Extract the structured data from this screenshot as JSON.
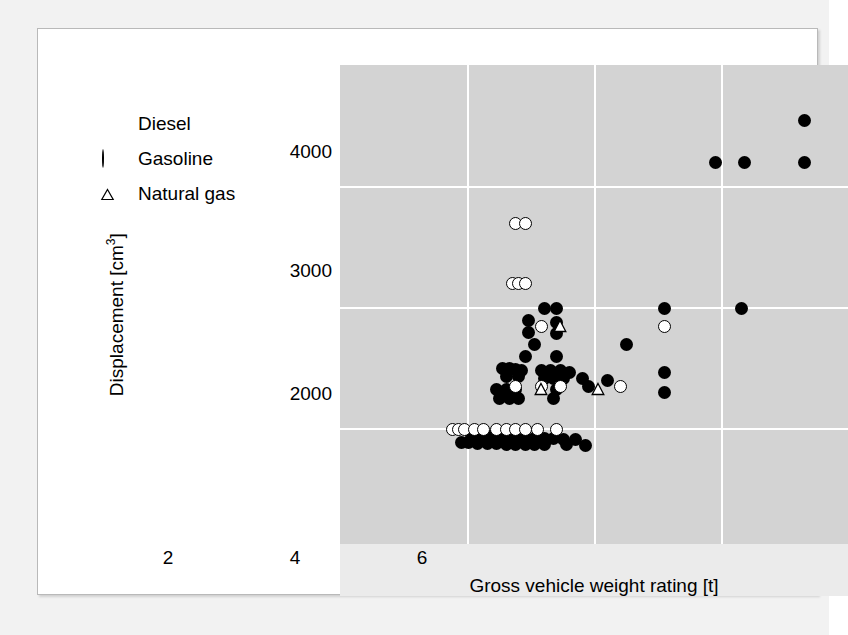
{
  "figure": {
    "panel_bg": "#d3d3d3",
    "grid_color": "#ffffff",
    "card_bg": "#ffffff",
    "page_bg": "#f2f2f2"
  },
  "legend": {
    "items": [
      {
        "label": "Diesel",
        "symbol": "filled-circle",
        "key": "diesel"
      },
      {
        "label": "Gasoline",
        "symbol": "open-circle",
        "key": "gasoline"
      },
      {
        "label": "Natural gas",
        "symbol": "open-triangle",
        "key": "natural_gas"
      }
    ]
  },
  "axes": {
    "x_label": "Gross vehicle weight rating [t]",
    "x_ticks": [
      "2",
      "4",
      "6"
    ],
    "x_tick_values": [
      2,
      4,
      6
    ],
    "y_label_text": "Displacement [cm",
    "y_label_sup": "3",
    "y_label_suffix": "]",
    "y_ticks": [
      "2000",
      "3000",
      "4000"
    ],
    "y_tick_values": [
      2000,
      3000,
      4000
    ]
  },
  "chart_data": {
    "type": "scatter",
    "title": "",
    "xlabel": "Gross vehicle weight rating [t]",
    "ylabel": "Displacement [cm3]",
    "xlim": [
      1.3,
      7.8
    ],
    "ylim": [
      1700,
      4750
    ],
    "grid": true,
    "legend_position": "upper-left-outside",
    "series": [
      {
        "name": "Diesel",
        "marker": "filled-circle",
        "color": "#000000",
        "points": [
          [
            7.3,
            4550
          ],
          [
            5.9,
            4200
          ],
          [
            6.35,
            4200
          ],
          [
            7.3,
            4200
          ],
          [
            3.2,
            3000
          ],
          [
            3.4,
            3000
          ],
          [
            5.1,
            3000
          ],
          [
            6.3,
            3000
          ],
          [
            2.95,
            2900
          ],
          [
            3.4,
            2880
          ],
          [
            4.5,
            2700
          ],
          [
            2.95,
            2800
          ],
          [
            3.4,
            2790
          ],
          [
            3.05,
            2700
          ],
          [
            2.9,
            2600
          ],
          [
            3.4,
            2600
          ],
          [
            5.1,
            2470
          ],
          [
            2.55,
            2500
          ],
          [
            2.65,
            2500
          ],
          [
            2.75,
            2490
          ],
          [
            2.85,
            2480
          ],
          [
            3.15,
            2480
          ],
          [
            3.3,
            2480
          ],
          [
            3.45,
            2480
          ],
          [
            3.6,
            2470
          ],
          [
            2.6,
            2430
          ],
          [
            2.8,
            2430
          ],
          [
            3.2,
            2420
          ],
          [
            3.35,
            2420
          ],
          [
            3.5,
            2420
          ],
          [
            3.8,
            2420
          ],
          [
            4.2,
            2400
          ],
          [
            3.9,
            2350
          ],
          [
            5.1,
            2300
          ],
          [
            2.45,
            2330
          ],
          [
            2.6,
            2330
          ],
          [
            2.75,
            2330
          ],
          [
            3.4,
            2330
          ],
          [
            2.5,
            2250
          ],
          [
            2.65,
            2250
          ],
          [
            2.8,
            2250
          ],
          [
            3.35,
            2250
          ],
          [
            2.05,
            1950
          ],
          [
            2.2,
            1950
          ],
          [
            2.35,
            1940
          ],
          [
            2.5,
            1940
          ],
          [
            2.6,
            1930
          ],
          [
            2.75,
            1930
          ],
          [
            2.9,
            1930
          ],
          [
            3.05,
            1920
          ],
          [
            3.2,
            1920
          ],
          [
            3.35,
            1920
          ],
          [
            3.5,
            1910
          ],
          [
            3.7,
            1910
          ],
          [
            1.9,
            1890
          ],
          [
            2.0,
            1890
          ],
          [
            2.15,
            1880
          ],
          [
            2.3,
            1880
          ],
          [
            2.45,
            1880
          ],
          [
            2.6,
            1875
          ],
          [
            2.75,
            1875
          ],
          [
            2.9,
            1870
          ],
          [
            3.05,
            1870
          ],
          [
            3.2,
            1870
          ],
          [
            3.55,
            1870
          ],
          [
            3.85,
            1860
          ]
        ]
      },
      {
        "name": "Gasoline",
        "marker": "open-circle",
        "color": "#ffffff",
        "points": [
          [
            2.75,
            3700
          ],
          [
            2.9,
            3700
          ],
          [
            2.7,
            3200
          ],
          [
            2.8,
            3200
          ],
          [
            2.9,
            3200
          ],
          [
            3.15,
            2850
          ],
          [
            5.1,
            2850
          ],
          [
            2.75,
            2350
          ],
          [
            3.15,
            2350
          ],
          [
            3.45,
            2350
          ],
          [
            4.4,
            2350
          ],
          [
            1.75,
            2000
          ],
          [
            1.85,
            2000
          ],
          [
            1.95,
            2000
          ],
          [
            2.1,
            2000
          ],
          [
            2.25,
            2000
          ],
          [
            2.45,
            2000
          ],
          [
            2.6,
            2000
          ],
          [
            2.75,
            2000
          ],
          [
            2.9,
            2000
          ],
          [
            3.1,
            2000
          ],
          [
            3.4,
            2000
          ]
        ]
      },
      {
        "name": "Natural gas",
        "marker": "open-triangle",
        "color": "#ffffff",
        "points": [
          [
            3.45,
            2850
          ],
          [
            3.15,
            2330
          ],
          [
            4.05,
            2330
          ]
        ]
      }
    ]
  }
}
